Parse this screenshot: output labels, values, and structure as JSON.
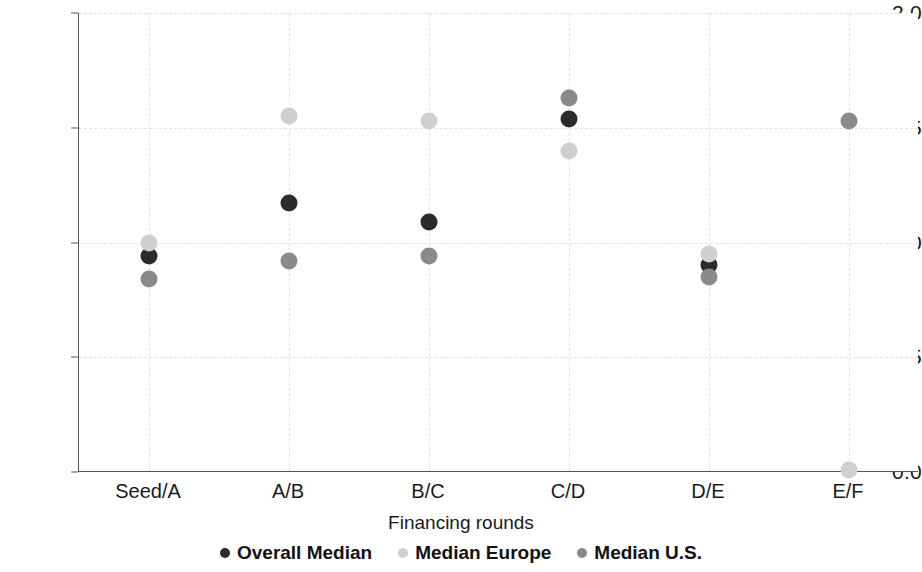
{
  "chart_data": {
    "type": "scatter",
    "title": "",
    "xlabel": "Financing rounds",
    "ylabel": "Median time difference (in years)",
    "categories": [
      "Seed/A",
      "A/B",
      "B/C",
      "C/D",
      "D/E",
      "E/F"
    ],
    "ylim": [
      0.0,
      2.0
    ],
    "yticks": [
      "0.0",
      "0.5",
      "1.0",
      "1.5",
      "2.0"
    ],
    "ytick_values": [
      0.0,
      0.5,
      1.0,
      1.5,
      2.0
    ],
    "grid": true,
    "legend_position": "bottom",
    "series": [
      {
        "name": "Overall Median",
        "color": "#2b2b2b",
        "values": [
          0.94,
          1.17,
          1.09,
          1.54,
          0.9,
          null
        ]
      },
      {
        "name": "Median Europe",
        "color": "#cfcfcf",
        "values": [
          1.0,
          1.55,
          1.53,
          1.4,
          0.95,
          0.01
        ]
      },
      {
        "name": "Median U.S.",
        "color": "#8a8a8a",
        "values": [
          0.84,
          0.92,
          0.94,
          1.63,
          0.85,
          1.53
        ]
      }
    ]
  },
  "axis": {
    "y_title": "Median time difference (in years)",
    "x_title": "Financing rounds"
  },
  "legend": {
    "items": [
      {
        "label": "Overall Median",
        "color": "#2b2b2b"
      },
      {
        "label": "Median Europe",
        "color": "#cfcfcf"
      },
      {
        "label": "Median U.S.",
        "color": "#8a8a8a"
      }
    ]
  }
}
